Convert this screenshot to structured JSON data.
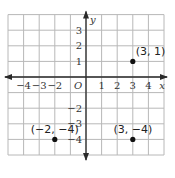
{
  "chart_data": {
    "type": "scatter",
    "title": "",
    "xlabel": "x",
    "ylabel": "y",
    "origin_label": "O",
    "xlim": [
      -5,
      5
    ],
    "ylim": [
      -5,
      4
    ],
    "grid": true,
    "x_ticks": [
      -4,
      -3,
      -2,
      1,
      2,
      3,
      4
    ],
    "x_tick_labels": [
      "−4",
      "−3",
      "−2",
      "1",
      "2",
      "3",
      "4"
    ],
    "y_ticks": [
      3,
      2,
      1,
      -2,
      -3,
      -4
    ],
    "y_tick_labels": [
      "3",
      "2",
      "1",
      "−2",
      "−3",
      "−4"
    ],
    "points": [
      {
        "x": 3,
        "y": 1,
        "label": "(3, 1)"
      },
      {
        "x": -2,
        "y": -4,
        "label": "(−2, −4)"
      },
      {
        "x": 3,
        "y": -4,
        "label": "(3, −4)"
      }
    ]
  },
  "colors": {
    "grid": "#b8b8b8",
    "axis": "#2a2a2a",
    "point": "#111111",
    "text": "#333333"
  }
}
